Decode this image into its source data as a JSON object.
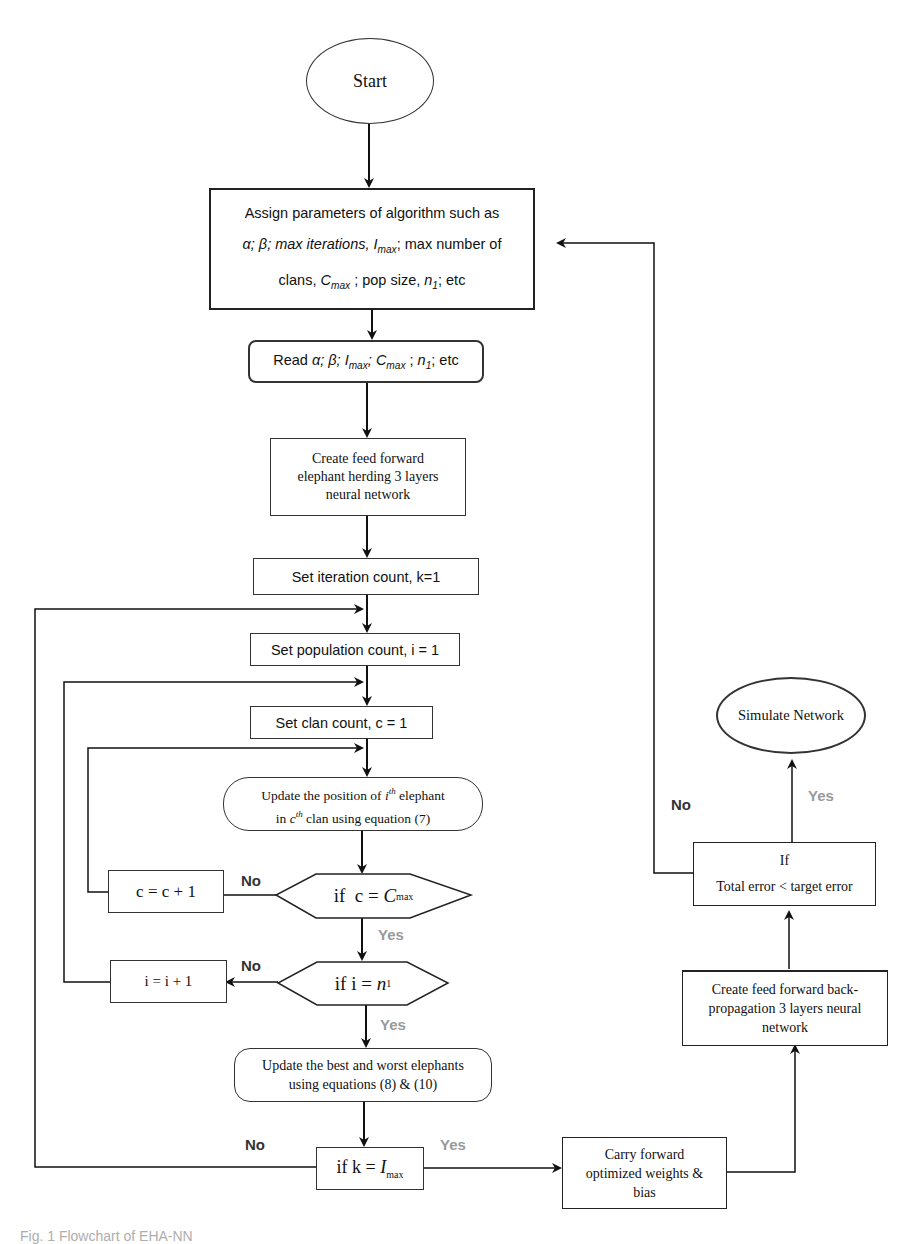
{
  "diagram": {
    "type": "flowchart",
    "nodes": {
      "start": {
        "label": "Start",
        "shape": "ellipse"
      },
      "assign_params": {
        "line1": "Assign parameters of algorithm such as",
        "line2_pre": "α; β; max iterations, ",
        "line2_var": "I",
        "line2_sub": "max",
        "line2_post": "; max number of",
        "line3_pre": "clans, ",
        "line3_var": "C",
        "line3_sub": "max",
        "line3_mid": " ; pop size, ",
        "line3_var2": "n",
        "line3_sub2": "1",
        "line3_post": "; etc",
        "shape": "rectangle"
      },
      "read_params": {
        "pre": "Read ",
        "text": "α; β; ",
        "v1": "I",
        "s1": "max",
        "sep1": "; ",
        "v2": "C",
        "s2": "max",
        "sep2": " ; ",
        "v3": "n",
        "s3": "1",
        "post": "; etc",
        "shape": "rounded-rectangle"
      },
      "create_ehnn": {
        "lines": [
          "Create feed forward",
          "elephant herding 3 layers",
          "neural network"
        ],
        "shape": "rectangle"
      },
      "set_k": {
        "label": "Set iteration count, k=1",
        "shape": "rectangle"
      },
      "set_i": {
        "label": "Set population count, i = 1",
        "shape": "rectangle"
      },
      "set_c": {
        "label": "Set clan count, c = 1",
        "shape": "rectangle"
      },
      "update_position": {
        "line1_pre": "Update the position of ",
        "line1_var": "i",
        "line1_sup": "th",
        "line1_post": " elephant",
        "line2_pre": "in ",
        "line2_var": "c",
        "line2_sup": "th",
        "line2_post": " clan using equation (7)",
        "shape": "rounded-rectangle"
      },
      "if_c": {
        "pre": "if  c = ",
        "var": "C",
        "sub": "max",
        "shape": "hexagon"
      },
      "c_inc": {
        "label": "c = c + 1",
        "shape": "rectangle"
      },
      "if_i": {
        "pre": "if i = ",
        "var": "n",
        "sub": "1",
        "shape": "hexagon"
      },
      "i_inc": {
        "label": "i = i + 1",
        "shape": "rectangle"
      },
      "update_best_worst": {
        "lines": [
          "Update the best and worst elephants",
          "using equations (8) & (10)"
        ],
        "shape": "rounded-rectangle"
      },
      "if_k": {
        "pre": "if k = ",
        "var": "I",
        "sub": "max",
        "shape": "rectangle"
      },
      "carry_forward": {
        "lines": [
          "Carry forward",
          "optimized weights &",
          "bias"
        ],
        "shape": "rectangle"
      },
      "create_bpnn": {
        "lines": [
          "Create feed forward back-",
          "propagation 3 layers neural",
          "network"
        ],
        "shape": "rectangle"
      },
      "if_error": {
        "line1": "If",
        "line2": "Total error < target error",
        "shape": "rectangle"
      },
      "simulate": {
        "label": "Simulate Network",
        "shape": "ellipse"
      }
    },
    "edge_labels": {
      "if_c_no": "No",
      "if_c_yes": "Yes",
      "if_i_no": "No",
      "if_i_yes": "Yes",
      "if_k_no": "No",
      "if_k_yes": "Yes",
      "if_error_no": "No",
      "if_error_yes": "Yes"
    },
    "edges": [
      [
        "start",
        "assign_params"
      ],
      [
        "assign_params",
        "read_params"
      ],
      [
        "read_params",
        "create_ehnn"
      ],
      [
        "create_ehnn",
        "set_k"
      ],
      [
        "set_k",
        "set_i"
      ],
      [
        "set_i",
        "set_c"
      ],
      [
        "set_c",
        "update_position"
      ],
      [
        "update_position",
        "if_c"
      ],
      [
        "if_c",
        "c_inc",
        "No"
      ],
      [
        "c_inc",
        "update_position"
      ],
      [
        "if_c",
        "if_i",
        "Yes"
      ],
      [
        "if_i",
        "i_inc",
        "No"
      ],
      [
        "i_inc",
        "set_c"
      ],
      [
        "if_i",
        "update_best_worst",
        "Yes"
      ],
      [
        "update_best_worst",
        "if_k"
      ],
      [
        "if_k",
        "set_i",
        "No"
      ],
      [
        "if_k",
        "carry_forward",
        "Yes"
      ],
      [
        "carry_forward",
        "create_bpnn"
      ],
      [
        "create_bpnn",
        "if_error"
      ],
      [
        "if_error",
        "simulate",
        "Yes"
      ],
      [
        "if_error",
        "assign_params",
        "No"
      ]
    ],
    "caption": "Fig. 1  Flowchart of EHA-NN"
  }
}
